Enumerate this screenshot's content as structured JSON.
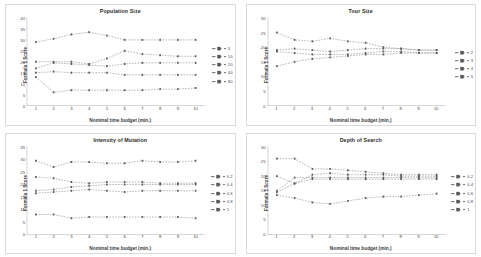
{
  "figure": {
    "background": "#ffffff",
    "panel_border": "#d9d9d9",
    "axis_color": "#808080",
    "grid": false,
    "series_color": "#595959"
  },
  "common": {
    "xlabel": "Nominal time budget (min.)",
    "ylabel": "Formula 1 Score",
    "xticks": [
      "1",
      "2",
      "3",
      "4",
      "5",
      "6",
      "7",
      "8",
      "9",
      "10"
    ],
    "x": [
      1,
      2,
      3,
      4,
      5,
      6,
      7,
      8,
      9,
      10
    ]
  },
  "chart_data": [
    {
      "type": "line",
      "title": "Population Size",
      "xlabel": "Nominal time budget (min.)",
      "ylabel": "Formula 1 Score",
      "x": [
        1,
        2,
        3,
        4,
        5,
        6,
        7,
        8,
        9,
        10
      ],
      "xlim": [
        1,
        10
      ],
      "ylim": [
        0,
        40
      ],
      "yticks": [
        "0",
        "5",
        "10",
        "15",
        "20",
        "25",
        "30",
        "35",
        "40"
      ],
      "grid": false,
      "legend_position": "right",
      "series": [
        {
          "name": "5",
          "values": [
            29.0,
            30.5,
            32.5,
            33.5,
            32.0,
            30.0,
            30.0,
            30.0,
            30.0,
            30.0
          ]
        },
        {
          "name": "10",
          "values": [
            20.0,
            20.0,
            20.0,
            19.0,
            21.5,
            25.0,
            23.5,
            23.0,
            22.5,
            22.5
          ]
        },
        {
          "name": "20",
          "values": [
            17.0,
            19.5,
            19.0,
            18.5,
            18.0,
            19.0,
            19.5,
            19.5,
            19.5,
            19.5
          ]
        },
        {
          "name": "40",
          "values": [
            15.0,
            15.5,
            15.0,
            15.0,
            15.0,
            14.0,
            14.0,
            14.0,
            14.0,
            14.0
          ]
        },
        {
          "name": "80",
          "values": [
            13.0,
            6.0,
            7.0,
            7.0,
            7.0,
            7.0,
            7.0,
            7.5,
            7.5,
            8.0
          ]
        }
      ]
    },
    {
      "type": "line",
      "title": "Tour Size",
      "xlabel": "Nominal time budget (min.)",
      "ylabel": "Formula 1 Score",
      "x": [
        1,
        2,
        3,
        4,
        5,
        6,
        7,
        8,
        9,
        10
      ],
      "xlim": [
        1,
        10
      ],
      "ylim": [
        0,
        30
      ],
      "yticks": [
        "0",
        "5",
        "10",
        "15",
        "20",
        "25",
        "30"
      ],
      "grid": false,
      "legend_position": "right",
      "series": [
        {
          "name": "2",
          "values": [
            25.0,
            22.5,
            22.0,
            23.0,
            22.0,
            21.5,
            20.0,
            19.5,
            19.0,
            19.0
          ]
        },
        {
          "name": "3",
          "values": [
            19.0,
            19.5,
            19.0,
            18.5,
            19.0,
            19.5,
            19.5,
            19.5,
            19.0,
            19.0
          ]
        },
        {
          "name": "4",
          "values": [
            18.5,
            18.0,
            17.5,
            17.5,
            17.5,
            18.0,
            18.5,
            18.5,
            18.0,
            18.0
          ]
        },
        {
          "name": "5",
          "values": [
            13.5,
            15.0,
            16.0,
            16.5,
            17.0,
            17.5,
            17.5,
            18.0,
            18.0,
            18.0
          ]
        }
      ]
    },
    {
      "type": "line",
      "title": "Intensity of Mutation",
      "xlabel": "Nominal time budget (min.)",
      "ylabel": "Formula 1 Score",
      "x": [
        1,
        2,
        3,
        4,
        5,
        6,
        7,
        8,
        9,
        10
      ],
      "xlim": [
        1,
        10
      ],
      "ylim": [
        0,
        35
      ],
      "yticks": [
        "0",
        "5",
        "10",
        "15",
        "20",
        "25",
        "30",
        "35"
      ],
      "grid": false,
      "legend_position": "right",
      "series": [
        {
          "name": "0.2",
          "values": [
            29.5,
            27.0,
            29.0,
            29.0,
            28.5,
            28.5,
            29.5,
            29.0,
            29.0,
            29.5
          ]
        },
        {
          "name": "0.4",
          "values": [
            23.0,
            22.5,
            21.0,
            20.5,
            21.0,
            21.0,
            21.0,
            20.5,
            20.5,
            20.5
          ]
        },
        {
          "name": "0.6",
          "values": [
            17.5,
            18.0,
            19.0,
            19.5,
            20.0,
            20.0,
            20.0,
            20.0,
            20.0,
            20.0
          ]
        },
        {
          "name": "0.8",
          "values": [
            16.5,
            17.0,
            17.5,
            18.0,
            17.5,
            17.0,
            17.5,
            17.5,
            17.5,
            17.5
          ]
        },
        {
          "name": "1",
          "values": [
            8.0,
            8.0,
            6.5,
            7.0,
            7.0,
            7.0,
            7.0,
            7.0,
            7.0,
            6.5
          ]
        }
      ]
    },
    {
      "type": "line",
      "title": "Depth of Search",
      "xlabel": "Nominal time budget (min.)",
      "ylabel": "Formula 1 Score",
      "x": [
        1,
        2,
        3,
        4,
        5,
        6,
        7,
        8,
        9,
        10
      ],
      "xlim": [
        1,
        10
      ],
      "ylim": [
        0,
        30
      ],
      "yticks": [
        "0",
        "5",
        "10",
        "15",
        "20",
        "25",
        "30"
      ],
      "grid": false,
      "legend_position": "right",
      "series": [
        {
          "name": "0.2",
          "values": [
            26.0,
            26.0,
            22.5,
            22.5,
            22.0,
            21.5,
            21.0,
            20.5,
            20.5,
            20.5
          ]
        },
        {
          "name": "0.4",
          "values": [
            20.0,
            17.5,
            20.5,
            21.0,
            20.5,
            20.5,
            20.5,
            20.0,
            20.0,
            20.0
          ]
        },
        {
          "name": "0.6",
          "values": [
            15.0,
            19.5,
            19.5,
            19.5,
            19.5,
            19.5,
            19.5,
            19.5,
            19.5,
            19.5
          ]
        },
        {
          "name": "0.8",
          "values": [
            14.5,
            17.5,
            19.0,
            19.0,
            19.0,
            19.0,
            19.0,
            19.0,
            19.0,
            19.0
          ]
        },
        {
          "name": "1",
          "values": [
            13.5,
            12.5,
            11.0,
            10.5,
            11.5,
            12.5,
            13.0,
            13.0,
            13.5,
            14.0
          ]
        }
      ]
    }
  ]
}
